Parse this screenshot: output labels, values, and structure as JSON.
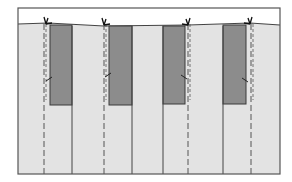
{
  "diagram": {
    "type": "pleat-fold-illustration",
    "colors": {
      "background": "#ffffff",
      "frame": "#555555",
      "fabric": "#e3e3e3",
      "fold_panel": "#8c8c8c",
      "fold_panel_edge": "#3a3a3a",
      "line": "#444444",
      "dashed_line": "#555555"
    },
    "frame": {
      "x": 18,
      "y": 8,
      "width": 262,
      "height": 166
    },
    "top_edge": {
      "points": "18,24 48,23 104,26 188,25 250,23 280,25"
    },
    "fold_panels": [
      {
        "id": "panel-1",
        "x": 50,
        "y": 25,
        "width": 22,
        "height": 80
      },
      {
        "id": "panel-2",
        "x": 109,
        "y": 26,
        "width": 23,
        "height": 79
      },
      {
        "id": "panel-3",
        "x": 163,
        "y": 26,
        "width": 22,
        "height": 78
      },
      {
        "id": "panel-4",
        "x": 223,
        "y": 25,
        "width": 23,
        "height": 79
      }
    ],
    "fold_lines_solid": [
      72,
      132,
      163,
      223
    ],
    "fold_lines_dashed": [
      44,
      104,
      188,
      251
    ],
    "arrows": [
      {
        "id": "arrow-1",
        "x": 46,
        "y": 24,
        "direction": "left"
      },
      {
        "id": "arrow-2",
        "x": 104,
        "y": 25,
        "direction": "left"
      },
      {
        "id": "arrow-3",
        "x": 188,
        "y": 25,
        "direction": "right"
      },
      {
        "id": "arrow-4",
        "x": 250,
        "y": 24,
        "direction": "right"
      }
    ],
    "tick_marks": [
      {
        "x": 52,
        "y": 77,
        "side": "left"
      },
      {
        "x": 111,
        "y": 73,
        "side": "left"
      },
      {
        "x": 181,
        "y": 75,
        "side": "right"
      },
      {
        "x": 242,
        "y": 78,
        "side": "right"
      }
    ]
  }
}
